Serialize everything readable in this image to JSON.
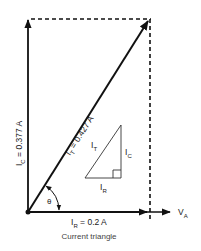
{
  "figure": {
    "caption": "Current triangle",
    "colors": {
      "stroke": "#111111",
      "text": "#1a1a1a",
      "caption": "#444444",
      "background": "#ffffff"
    }
  },
  "vectors": {
    "capacitive": {
      "symbol": "I",
      "subscript": "C",
      "value_text": " = 0.377 A"
    },
    "total": {
      "symbol": "I",
      "subscript": "T",
      "value_text": " = 0.427 A"
    },
    "resistive": {
      "symbol": "I",
      "subscript": "R",
      "value_text": " = 0.2 A"
    },
    "reference": {
      "symbol": "V",
      "subscript": "A"
    }
  },
  "angle": {
    "symbol": "θ"
  },
  "inset_triangle": {
    "hypotenuse": {
      "symbol": "I",
      "subscript": "T"
    },
    "vertical": {
      "symbol": "I",
      "subscript": "C"
    },
    "horizontal": {
      "symbol": "I",
      "subscript": "R"
    }
  }
}
